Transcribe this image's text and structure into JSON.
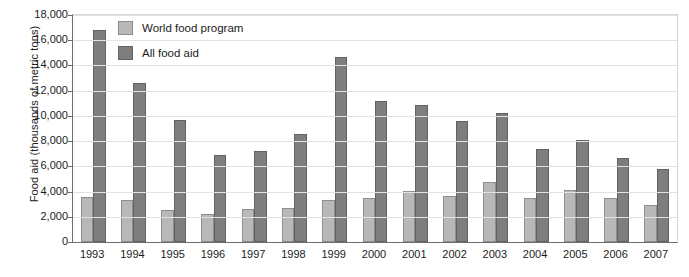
{
  "chart_data": {
    "type": "bar",
    "title": "",
    "xlabel": "",
    "ylabel": "Food aid (thousands of metric tons)",
    "ylim": [
      0,
      18000
    ],
    "ytick_step": 2000,
    "yticks": [
      "0",
      "2,000",
      "4,000",
      "6,000",
      "8,000",
      "10,000",
      "12,000",
      "14,000",
      "16,000",
      "18,000"
    ],
    "grid": true,
    "legend_position": "top-left-inside",
    "categories": [
      "1993",
      "1994",
      "1995",
      "1996",
      "1997",
      "1998",
      "1999",
      "2000",
      "2001",
      "2002",
      "2003",
      "2004",
      "2005",
      "2006",
      "2007"
    ],
    "series": [
      {
        "name": "World food program",
        "color": "#b8b8b8",
        "values": [
          3600,
          3300,
          2550,
          2200,
          2650,
          2700,
          3300,
          3500,
          4050,
          3650,
          4750,
          3500,
          4100,
          3500,
          2950
        ]
      },
      {
        "name": "All food aid",
        "color": "#7e7e7e",
        "values": [
          16800,
          12600,
          9700,
          6900,
          7200,
          8600,
          14700,
          11200,
          10900,
          9600,
          10200,
          7400,
          8100,
          6700,
          5800
        ]
      }
    ]
  }
}
